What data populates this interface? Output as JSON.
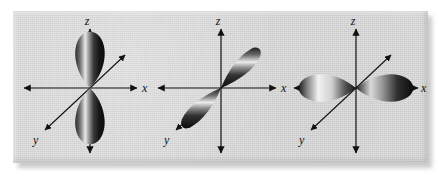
{
  "figure": {
    "kind": "orbital-diagram",
    "plate_color": "#d6d6d6",
    "ink_color": "#111111",
    "lobe_dark": "#111111",
    "lobe_light": "#f2f2f2"
  },
  "axes": {
    "z_label": "z",
    "x_label": "x",
    "y_label": "y"
  },
  "panels": [
    {
      "name": "p-z-orbital",
      "orbital": "pz",
      "lobe_axis": "z",
      "lobe_count": 2,
      "labels": {
        "z": "z",
        "x": "x",
        "y": "y"
      }
    },
    {
      "name": "p-y-orbital",
      "orbital": "py",
      "lobe_axis": "y",
      "lobe_count": 2,
      "labels": {
        "z": "z",
        "x": "x",
        "y": "y"
      }
    },
    {
      "name": "p-x-orbital",
      "orbital": "px",
      "lobe_axis": "x",
      "lobe_count": 2,
      "labels": {
        "z": "z",
        "x": "x",
        "y": "y"
      }
    }
  ]
}
